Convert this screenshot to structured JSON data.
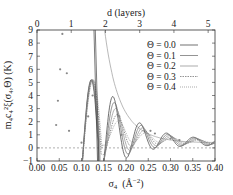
{
  "chart_data": {
    "type": "line",
    "title": "",
    "xlabel": "σ4  (Å⁻²)",
    "ylabel": "m4c4²ξ(σ4,Θ)  (K)",
    "x2label": "d  (layers)",
    "xlim": [
      0.0,
      0.4
    ],
    "ylim": [
      -1,
      9
    ],
    "x_ticks": [
      "0.00",
      "0.05",
      "0.10",
      "0.15",
      "0.20",
      "0.25",
      "0.30",
      "0.35",
      "0.40"
    ],
    "y_ticks": [
      "-1",
      "0",
      "1",
      "2",
      "3",
      "4",
      "5",
      "6",
      "7",
      "8",
      "9"
    ],
    "x2_ticks": [
      "0",
      "1",
      "2",
      "3",
      "4",
      "5"
    ],
    "grid": false,
    "legend_position": "upper right",
    "zero_line": "dashed",
    "series": [
      {
        "name": "Θ = 0.0",
        "style": "solid",
        "peaks": [
          {
            "x": 0.122,
            "y": 5.2
          },
          {
            "x": 0.172,
            "y": 5.2
          },
          {
            "x": 0.232,
            "y": 2.0
          },
          {
            "x": 0.29,
            "y": 1.0
          }
        ]
      },
      {
        "name": "Θ = 0.1",
        "style": "solid",
        "peaks": [
          {
            "x": 0.175,
            "y": 4.1
          },
          {
            "x": 0.237,
            "y": 1.7
          }
        ]
      },
      {
        "name": "Θ = 0.2",
        "style": "solid",
        "peaks": [
          {
            "x": 0.178,
            "y": 3.2
          },
          {
            "x": 0.242,
            "y": 1.5
          }
        ]
      },
      {
        "name": "Θ = 0.3",
        "style": "dotted",
        "peaks": [
          {
            "x": 0.182,
            "y": 2.6
          },
          {
            "x": 0.246,
            "y": 1.3
          }
        ]
      },
      {
        "name": "Θ = 0.4",
        "style": "dotted",
        "peaks": [
          {
            "x": 0.186,
            "y": 2.2
          },
          {
            "x": 0.25,
            "y": 1.1
          }
        ]
      }
    ],
    "envelope_curve": {
      "description": "smooth decaying upper envelope",
      "points": [
        [
          0.152,
          9.0
        ],
        [
          0.2,
          4.5
        ],
        [
          0.25,
          2.6
        ],
        [
          0.3,
          1.6
        ],
        [
          0.35,
          1.0
        ],
        [
          0.4,
          0.7
        ]
      ]
    },
    "scatter_points": [
      [
        0.043,
        1.75
      ],
      [
        0.047,
        3.6
      ],
      [
        0.052,
        6.0
      ],
      [
        0.057,
        8.7
      ],
      [
        0.067,
        5.7
      ],
      [
        0.072,
        1.3
      ],
      [
        0.1,
        0.4
      ],
      [
        0.115,
        2.4
      ],
      [
        0.125,
        4.0
      ],
      [
        0.185,
        2.4
      ],
      [
        0.19,
        1.0
      ],
      [
        0.255,
        1.3
      ],
      [
        0.265,
        1.1
      ],
      [
        0.3,
        0.7
      ],
      [
        0.32,
        0.6
      ]
    ]
  },
  "legend": {
    "items": [
      "Θ = 0.0",
      "Θ = 0.1",
      "Θ = 0.2",
      "Θ = 0.3",
      "Θ = 0.4"
    ]
  },
  "axes": {
    "xlabel_main": "σ",
    "xlabel_sub": "4",
    "xlabel_unit": "(Å",
    "xlabel_exp": "−2",
    "xlabel_close": ")",
    "ylabel": "m₄c₄²ξ(σ₄,Θ)  (K)",
    "x2label": "d  (layers)"
  }
}
